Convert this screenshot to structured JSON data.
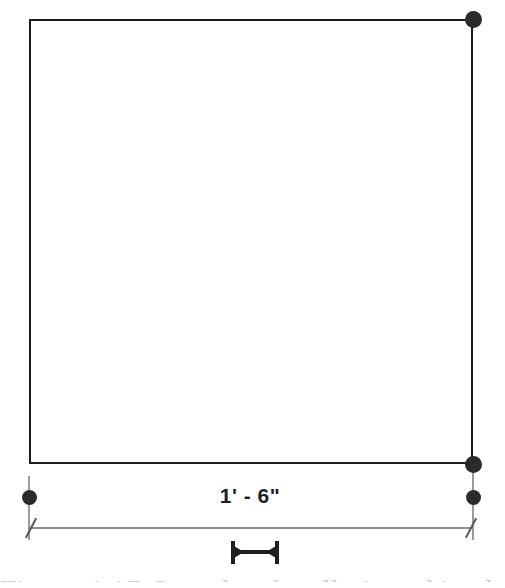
{
  "drawing": {
    "title": "Architectural dimension drawing",
    "background_color": "#ffffff",
    "outline_color": "#1c1c1c",
    "grip_color": "#2b2b2b",
    "dimension_line_color": "#8e8e8e",
    "extension_line_color": "#9a9a9a",
    "text_color": "#1f1f1f"
  },
  "shape": {
    "name": "rectangle",
    "left": 29,
    "top": 19,
    "width": 444,
    "height": 445,
    "stroke_width": 2
  },
  "grips": [
    {
      "name": "grip-top-right",
      "x": 473,
      "y": 19,
      "size": "large"
    },
    {
      "name": "grip-bottom-right",
      "x": 473,
      "y": 464,
      "size": "large"
    },
    {
      "name": "grip-extension-right",
      "x": 473,
      "y": 497,
      "size": "small"
    },
    {
      "name": "grip-extension-left",
      "x": 29,
      "y": 497,
      "size": "small"
    }
  ],
  "extension_lines": [
    {
      "name": "extension-line-left",
      "x": 29,
      "top": 476,
      "height": 64
    },
    {
      "name": "extension-line-right",
      "x": 473,
      "top": 470,
      "height": 70
    }
  ],
  "dimension": {
    "label": "1' - 6\"",
    "feet": 1,
    "inches": 6,
    "total_inches": 18,
    "line_y": 528,
    "start_x": 29,
    "end_x": 473,
    "text_x": 250,
    "text_y": 484,
    "tick_style": "architectural-slash"
  },
  "scale_bar": {
    "name": "scale-bar",
    "x": 255,
    "y": 540,
    "width": 54,
    "height": 25
  },
  "caption": {
    "text": "Figure 4-17 Completed wall viewed in elevation",
    "visible": "partially-cut-off"
  }
}
